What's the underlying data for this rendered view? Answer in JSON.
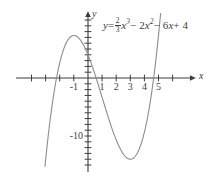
{
  "chart_data": {
    "type": "line",
    "title": "",
    "equation_text": "y = 2/3 x^3 - 2x^2 - 6x + 4",
    "equation_parts": {
      "lhs": "y",
      "equals": "=",
      "frac_num": "2",
      "frac_den": "3",
      "term1_var": "x",
      "term1_exp": "3",
      "term2": "− 2",
      "term2_var": "x",
      "term2_exp": "2",
      "term3": "− 6",
      "term3_var": "x",
      "term4": "+ 4"
    },
    "xlabel": "x",
    "ylabel": "y",
    "xlim": [
      -3.9,
      5.9
    ],
    "ylim": [
      -17.5,
      10.5
    ],
    "grid": false,
    "legend": null,
    "x_tick_labels": [
      "-1",
      "1",
      "2",
      "3",
      "4",
      "5"
    ],
    "x_tick_values": [
      -1,
      1,
      2,
      3,
      4,
      5
    ],
    "x_ticks_unlabeled": [
      -3,
      -2,
      0
    ],
    "y_tick_labels": [
      "-10"
    ],
    "y_tick_values": [
      -10
    ],
    "y_tick_step": 1,
    "curve": {
      "name": "cubic",
      "color": "#8c8c8c",
      "coefficients": {
        "a": 0.6666666667,
        "b": -2,
        "c": -6,
        "d": 4
      },
      "local_maximum": {
        "x": -1.095,
        "y": 8.04
      },
      "local_minimum": {
        "x": 3.095,
        "y": -14.04
      },
      "x_intercepts": [
        -2.47,
        0.6,
        4.87
      ],
      "y_intercept": 4,
      "x_domain_drawn": [
        -3.05,
        5.15
      ]
    },
    "axis_color": "#3d3d3d",
    "curve_color": "#8c8c8c",
    "background": "#ffffff"
  }
}
